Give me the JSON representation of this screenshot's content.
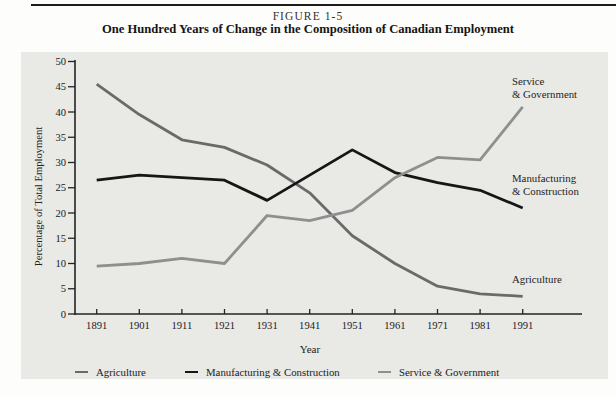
{
  "figure": {
    "label": "FIGURE 1-5",
    "title": "One Hundred Years of Change in the Composition of Canadian Employment"
  },
  "chart_data": {
    "type": "line",
    "title": "One Hundred Years of Change in the Composition of Canadian Employment",
    "x": [
      1891,
      1901,
      1911,
      1921,
      1931,
      1941,
      1951,
      1961,
      1971,
      1981,
      1991
    ],
    "xlabel": "Year",
    "ylabel": "Percentage of Total Employment",
    "ylim": [
      0,
      50
    ],
    "ytick_step": 5,
    "grid": false,
    "legend_position": "bottom",
    "axis_color": "#232323",
    "series": [
      {
        "name": "Agriculture",
        "color": "#6a6a6a",
        "values": [
          45.5,
          39.5,
          34.5,
          33,
          29.5,
          24,
          15.5,
          10,
          5.5,
          4,
          3.5
        ],
        "annotation_lines": [
          "Agriculture"
        ]
      },
      {
        "name": "Manufacturing & Construction",
        "color": "#161616",
        "values": [
          26.5,
          27.5,
          27,
          26.5,
          22.5,
          27.5,
          32.5,
          28,
          26,
          24.5,
          21
        ],
        "annotation_lines": [
          "Manufacturing",
          "& Construction"
        ]
      },
      {
        "name": "Service & Government",
        "color": "#8f8f8f",
        "values": [
          9.5,
          10,
          11,
          10,
          19.5,
          18.5,
          20.5,
          27,
          31,
          30.5,
          41
        ],
        "annotation_lines": [
          "Service",
          "& Government"
        ]
      }
    ]
  }
}
